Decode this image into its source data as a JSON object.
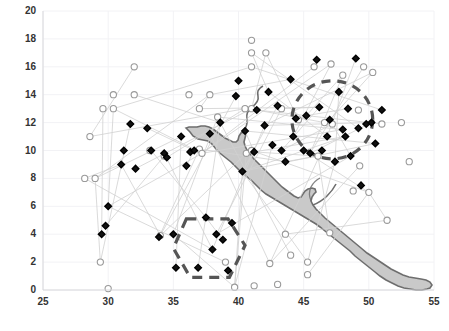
{
  "chart_data": {
    "type": "scatter",
    "title": "",
    "subtitle": "",
    "xlabel": "",
    "ylabel": "",
    "xlim": [
      25,
      55
    ],
    "ylim": [
      0,
      20
    ],
    "xticks": [
      25,
      30,
      35,
      40,
      45,
      50,
      55
    ],
    "yticks": [
      0,
      2,
      4,
      6,
      8,
      10,
      12,
      14,
      16,
      18,
      20
    ],
    "grid": true,
    "grid_color": "#f2f2f5",
    "legend": "none",
    "axis_label_color": "#333333",
    "background_map": {
      "name": "water-body-polygon",
      "description": "shaded gray sea/gulf running from upper-middle-left diagonally to lower-right",
      "fill": "#c9c9c9",
      "stroke": "#6e6e6e"
    },
    "annotations": [
      {
        "name": "dashed-ellipse-region",
        "shape": "ellipse",
        "style": "dashed",
        "color": "#555555",
        "center": [
          47.2,
          12.2
        ],
        "rx": 3.1,
        "ry": 2.8
      },
      {
        "name": "dashed-polygon-region",
        "shape": "polygon",
        "style": "dashed",
        "color": "#555555",
        "vertices": [
          [
            36.0,
            5.1
          ],
          [
            39.2,
            5.1
          ],
          [
            40.5,
            3.2
          ],
          [
            39.3,
            0.9
          ],
          [
            36.3,
            0.9
          ],
          [
            35.0,
            3.0
          ]
        ]
      }
    ],
    "series": [
      {
        "name": "open-circles",
        "marker": "circle-open",
        "marker_fill": "#ffffff",
        "marker_stroke": "#9a9a9a",
        "points": [
          [
            30.0,
            0.1
          ],
          [
            29.4,
            2.0
          ],
          [
            28.2,
            8.0
          ],
          [
            29.0,
            8.0
          ],
          [
            28.6,
            11.0
          ],
          [
            29.6,
            13.0
          ],
          [
            30.4,
            13.0
          ],
          [
            30.4,
            14.0
          ],
          [
            32.0,
            14.0
          ],
          [
            32.0,
            16.0
          ],
          [
            33.2,
            10.0
          ],
          [
            34.3,
            9.6
          ],
          [
            36.2,
            14.0
          ],
          [
            37.0,
            13.0
          ],
          [
            37.8,
            14.0
          ],
          [
            37.0,
            10.1
          ],
          [
            37.2,
            9.8
          ],
          [
            38.4,
            12.4
          ],
          [
            39.0,
            2.0
          ],
          [
            39.7,
            0.2
          ],
          [
            40.5,
            13.0
          ],
          [
            40.6,
            9.8
          ],
          [
            41.0,
            17.9
          ],
          [
            41.0,
            17.0
          ],
          [
            41.0,
            16.0
          ],
          [
            41.0,
            13.0
          ],
          [
            41.0,
            10.0
          ],
          [
            41.2,
            0.3
          ],
          [
            42.1,
            17.0
          ],
          [
            42.4,
            1.9
          ],
          [
            43.3,
            13.0
          ],
          [
            43.0,
            0.4
          ],
          [
            43.6,
            4.0
          ],
          [
            44.6,
            12.2
          ],
          [
            44.0,
            2.5
          ],
          [
            45.3,
            2.0
          ],
          [
            45.3,
            1.1
          ],
          [
            45.8,
            16.0
          ],
          [
            46.1,
            9.6
          ],
          [
            46.6,
            12.0
          ],
          [
            47.0,
            4.1
          ],
          [
            47.1,
            16.2
          ],
          [
            47.2,
            11.9
          ],
          [
            48.0,
            15.4
          ],
          [
            48.8,
            7.1
          ],
          [
            49.2,
            12.9
          ],
          [
            49.3,
            8.9
          ],
          [
            49.6,
            16.0
          ],
          [
            50.0,
            7.0
          ],
          [
            50.3,
            15.6
          ],
          [
            51.0,
            11.9
          ],
          [
            51.4,
            5.0
          ],
          [
            52.5,
            12.0
          ],
          [
            53.1,
            9.2
          ],
          [
            34.0,
            3.9
          ]
        ]
      },
      {
        "name": "filled-diamonds",
        "marker": "diamond-filled",
        "marker_fill": "#111111",
        "marker_stroke": "#000000",
        "points": [
          [
            29.5,
            4.0
          ],
          [
            29.8,
            4.6
          ],
          [
            30.0,
            6.0
          ],
          [
            31.0,
            9.0
          ],
          [
            31.2,
            10.0
          ],
          [
            31.7,
            11.9
          ],
          [
            32.1,
            8.7
          ],
          [
            33.0,
            11.6
          ],
          [
            33.3,
            10.0
          ],
          [
            33.9,
            3.8
          ],
          [
            34.3,
            9.8
          ],
          [
            34.5,
            9.5
          ],
          [
            35.0,
            4.0
          ],
          [
            35.2,
            1.6
          ],
          [
            35.6,
            11.0
          ],
          [
            36.0,
            8.9
          ],
          [
            36.3,
            9.9
          ],
          [
            36.6,
            10.0
          ],
          [
            36.9,
            1.6
          ],
          [
            37.5,
            5.2
          ],
          [
            37.8,
            11.2
          ],
          [
            38.0,
            2.9
          ],
          [
            38.3,
            4.0
          ],
          [
            38.6,
            12.0
          ],
          [
            38.8,
            3.6
          ],
          [
            39.2,
            1.4
          ],
          [
            39.5,
            4.8
          ],
          [
            39.8,
            13.9
          ],
          [
            40.0,
            15.0
          ],
          [
            40.3,
            8.5
          ],
          [
            40.5,
            11.4
          ],
          [
            41.2,
            9.9
          ],
          [
            41.4,
            12.9
          ],
          [
            42.0,
            11.8
          ],
          [
            42.3,
            14.2
          ],
          [
            42.6,
            10.4
          ],
          [
            43.0,
            13.2
          ],
          [
            43.3,
            10.0
          ],
          [
            43.6,
            9.2
          ],
          [
            44.0,
            15.1
          ],
          [
            44.2,
            11.0
          ],
          [
            44.4,
            12.3
          ],
          [
            45.0,
            10.0
          ],
          [
            45.2,
            12.5
          ],
          [
            45.5,
            9.8
          ],
          [
            46.0,
            16.5
          ],
          [
            46.2,
            13.1
          ],
          [
            46.4,
            10.0
          ],
          [
            46.8,
            11.0
          ],
          [
            47.0,
            12.2
          ],
          [
            47.4,
            9.2
          ],
          [
            47.7,
            14.2
          ],
          [
            48.0,
            11.5
          ],
          [
            48.2,
            11.0
          ],
          [
            48.4,
            13.0
          ],
          [
            48.6,
            9.6
          ],
          [
            49.0,
            16.6
          ],
          [
            49.2,
            11.6
          ],
          [
            49.4,
            7.5
          ],
          [
            49.8,
            11.9
          ],
          [
            50.2,
            12.0
          ],
          [
            50.5,
            10.5
          ],
          [
            51.0,
            12.9
          ]
        ]
      }
    ],
    "connector_lines": {
      "name": "migration-connector-lines",
      "color": "#d0d0d0",
      "width": 0.8,
      "description": "thin light-gray straight segments connecting paired observations"
    }
  }
}
